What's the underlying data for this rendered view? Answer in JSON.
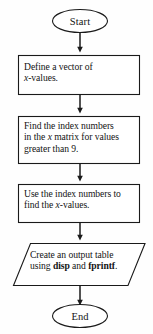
{
  "diagram": {
    "type": "flowchart",
    "orientation": "top-to-bottom",
    "background_color": "#fefefe",
    "line_color": "#1a1a1a",
    "text_color": "#131313",
    "nodes": [
      {
        "id": "start",
        "shape": "terminator",
        "label": "Start"
      },
      {
        "id": "process1",
        "shape": "process",
        "label": "Define a vector of x-values.",
        "lines": [
          "Define a vector of",
          "x-values."
        ]
      },
      {
        "id": "process2",
        "shape": "process",
        "label": "Find the index numbers in the x matrix for values greater than 9.",
        "lines": [
          "Find the index numbers",
          "in the x matrix for values",
          "greater than 9."
        ]
      },
      {
        "id": "process3",
        "shape": "process",
        "label": "Use the index numbers to find the x-values.",
        "lines": [
          "Use the index numbers to",
          "find the x-values."
        ]
      },
      {
        "id": "io",
        "shape": "parallelogram",
        "label": "Create an output table using disp and fprintf.",
        "lines": [
          "Create an output table",
          "using disp and fprintf."
        ]
      },
      {
        "id": "end",
        "shape": "terminator",
        "label": "End"
      }
    ],
    "edges": [
      {
        "from": "start",
        "to": "process1"
      },
      {
        "from": "process1",
        "to": "process2"
      },
      {
        "from": "process2",
        "to": "process3"
      },
      {
        "from": "process3",
        "to": "io"
      },
      {
        "from": "io",
        "to": "end"
      }
    ]
  }
}
